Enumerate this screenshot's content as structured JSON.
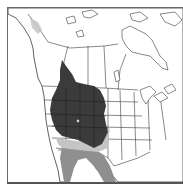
{
  "map": {
    "type": "species-range-map",
    "region": "North America (western focus)",
    "colors": {
      "frame": "#555555",
      "land": "#ffffff",
      "outline": "#3a3a3a",
      "range_primary": "#3b3b3b",
      "range_secondary": "#c4c4c4",
      "range_tertiary": "#8f8f8f"
    },
    "legend": [],
    "markers": [
      {
        "name": "location-dot",
        "x": 78,
        "y": 121
      }
    ]
  }
}
